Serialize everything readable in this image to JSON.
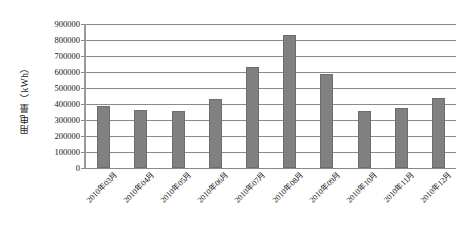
{
  "chart_data": {
    "type": "bar",
    "title": "",
    "subtitle": "",
    "xlabel": "",
    "ylabel": "用电量（kWh）",
    "categories": [
      "2010年03月",
      "2010年04月",
      "2010年05月",
      "2010年06月",
      "2010年07月",
      "2010年08月",
      "2010年09月",
      "2010年10月",
      "2010年11月",
      "2010年12月"
    ],
    "values": [
      385000,
      360000,
      355000,
      430000,
      630000,
      830000,
      590000,
      355000,
      375000,
      440000
    ],
    "ylim": [
      0,
      900000
    ],
    "ytick_values": [
      0,
      100000,
      200000,
      300000,
      400000,
      500000,
      600000,
      700000,
      800000,
      900000
    ],
    "ytick_labels": [
      "0",
      "100000",
      "200000",
      "300000",
      "400000",
      "500000",
      "600000",
      "700000",
      "800000",
      "900000"
    ],
    "grid": true,
    "grid_axis": "y",
    "legend": false,
    "legend_position": "none",
    "bar_color": "#808080",
    "bar_edge_color": "#6d6d6d",
    "gridline_color": "#8a8a8a",
    "axis_color": "#9a9a9a",
    "background_color": "#ffffff",
    "xtick_rotation": -45,
    "annotations": []
  }
}
